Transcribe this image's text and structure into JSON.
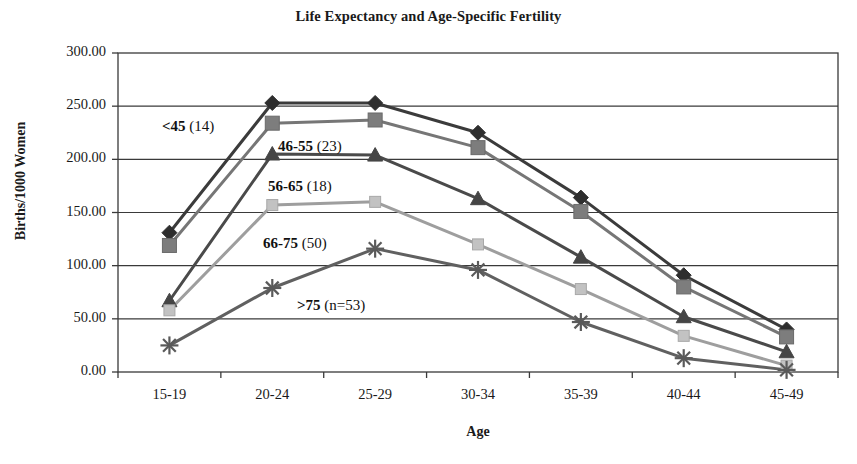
{
  "chart_data": {
    "type": "line",
    "title": "Life Expectancy and Age-Specific Fertility",
    "xlabel": "Age",
    "ylabel": "Births/1000 Women",
    "categories": [
      "15-19",
      "20-24",
      "25-29",
      "30-34",
      "35-39",
      "40-44",
      "45-49"
    ],
    "ylim": [
      0,
      300
    ],
    "ytick_labels": [
      "0.00",
      "50.00",
      "100.00",
      "150.00",
      "200.00",
      "250.00",
      "300.00"
    ],
    "ytick_values": [
      0,
      50,
      100,
      150,
      200,
      250,
      300
    ],
    "grid": true,
    "legend": "inline-annotations",
    "series": [
      {
        "name": "<45 (14)",
        "label_bold": "<45",
        "label_rest": " (14)",
        "marker": "diamond",
        "color": "#3b3b3b",
        "values": [
          131,
          253,
          253,
          225,
          164,
          91,
          40
        ]
      },
      {
        "name": "46-55 (23)",
        "label_bold": "46-55",
        "label_rest": " (23)",
        "marker": "square",
        "color": "#767676",
        "values": [
          119,
          234,
          237,
          211,
          151,
          80,
          33
        ]
      },
      {
        "name": "56-65 (18)",
        "label_bold": "56-65",
        "label_rest": " (18)",
        "marker": "triangle",
        "color": "#4a4a4a",
        "values": [
          67,
          205,
          204,
          163,
          108,
          52,
          19
        ]
      },
      {
        "name": "66-75 (50)",
        "label_bold": "66-75",
        "label_rest": " (50)",
        "marker": "square-light",
        "color": "#9e9e9e",
        "values": [
          58,
          157,
          160,
          120,
          78,
          34,
          6
        ]
      },
      {
        "name": ">75 (n=53)",
        "label_bold": ">75",
        "label_rest": " (n=53)",
        "marker": "asterisk",
        "color": "#606060",
        "values": [
          25,
          79,
          116,
          96,
          47,
          13,
          2
        ]
      }
    ],
    "annotations": [
      {
        "text": "<45 (14)",
        "bold": "<45",
        "rest": " (14)",
        "x": 162,
        "y": 118
      },
      {
        "text": "46-55 (23)",
        "bold": "46-55",
        "rest": " (23)",
        "x": 278,
        "y": 138
      },
      {
        "text": "56-65 (18)",
        "bold": "56-65",
        "rest": " (18)",
        "x": 268,
        "y": 178
      },
      {
        "text": "66-75 (50)",
        "bold": "66-75",
        "rest": " (50)",
        "x": 263,
        "y": 235
      },
      {
        "text": ">75 (n=53)",
        "bold": ">75",
        "rest": " (n=53)",
        "x": 297,
        "y": 297
      }
    ],
    "colors": {
      "axis": "#3a3a3a",
      "grid": "#3a3a3a",
      "background": "#ffffff",
      "text": "#1a1a1a"
    }
  }
}
